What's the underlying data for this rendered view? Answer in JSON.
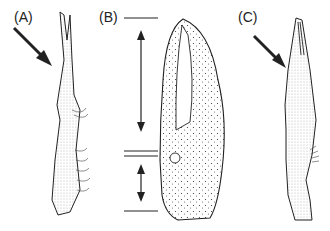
{
  "figure": {
    "panels": [
      {
        "id": "A",
        "label": "(A)",
        "description": "Appendage in lateral view with arrow pointing to tip"
      },
      {
        "id": "B",
        "label": "(B)",
        "description": "Chela with scale bars indicating finger length and palm length"
      },
      {
        "id": "C",
        "label": "(C)",
        "description": "Appendage in lateral view with arrow pointing to tip"
      }
    ],
    "colors": {
      "ink": "#222222",
      "background": "#ffffff"
    }
  }
}
